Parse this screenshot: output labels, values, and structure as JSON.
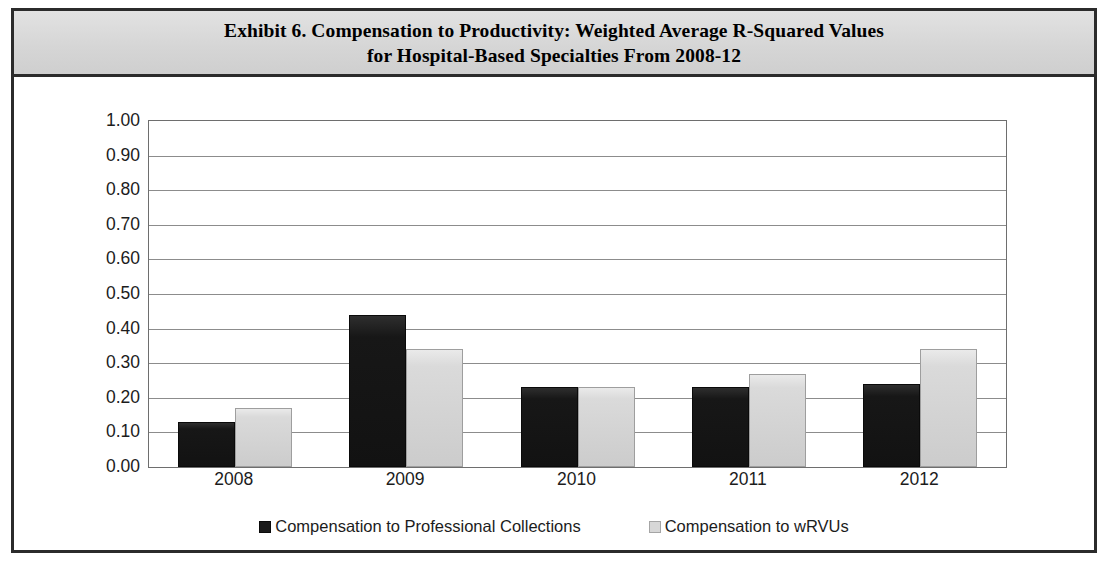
{
  "chart_data": {
    "type": "bar",
    "title": "Exhibit 6. Compensation to Productivity: Weighted Average R-Squared Values for Hospital-Based Specialties From 2008-12",
    "title_lines": [
      "Exhibit 6. Compensation to Productivity: Weighted Average R-Squared Values",
      "for Hospital-Based Specialties From 2008-12"
    ],
    "categories": [
      "2008",
      "2009",
      "2010",
      "2011",
      "2012"
    ],
    "series": [
      {
        "name": "Compensation to Professional Collections",
        "color": "#1a1a1a",
        "values": [
          0.13,
          0.44,
          0.23,
          0.23,
          0.24
        ]
      },
      {
        "name": "Compensation to wRVUs",
        "color": "#d7d7d7",
        "values": [
          0.17,
          0.34,
          0.23,
          0.27,
          0.34
        ]
      }
    ],
    "xlabel": "",
    "ylabel": "",
    "ylim": [
      0.0,
      1.0
    ],
    "ytick_step": 0.1,
    "ytick_labels": [
      "1.00",
      "0.90",
      "0.80",
      "0.70",
      "0.60",
      "0.50",
      "0.40",
      "0.30",
      "0.20",
      "0.10",
      "0.00"
    ],
    "grid": true,
    "legend_position": "bottom"
  }
}
